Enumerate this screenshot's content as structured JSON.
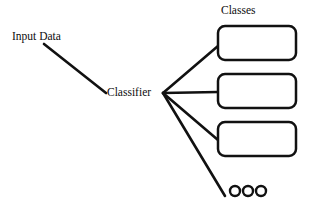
{
  "diagram": {
    "type": "classifier-flow-diagram",
    "background_color": "#ffffff",
    "stroke_color": "#111111",
    "text_color": "#0d0d0d",
    "labels": {
      "input": "Input Data",
      "classifier": "Classifier",
      "classes_title": "Classes"
    },
    "nodes": [
      {
        "id": "input-data",
        "kind": "text-label",
        "label": "Input Data",
        "x": 12,
        "y": 31
      },
      {
        "id": "classifier",
        "kind": "text-label",
        "label": "Classifier",
        "x": 107,
        "y": 87
      },
      {
        "id": "classes-title",
        "kind": "text-label",
        "label": "Classes",
        "x": 221,
        "y": 5
      }
    ],
    "class_boxes": [
      {
        "id": "class-box-1",
        "label": "",
        "x": 218,
        "y": 26,
        "width": 78,
        "height": 34,
        "rx": 7
      },
      {
        "id": "class-box-2",
        "label": "",
        "x": 218,
        "y": 74,
        "width": 78,
        "height": 34,
        "rx": 7
      },
      {
        "id": "class-box-3",
        "label": "",
        "x": 218,
        "y": 122,
        "width": 78,
        "height": 34,
        "rx": 7
      }
    ],
    "ellipsis_dots": {
      "id": "more-classes-ellipsis",
      "count": 3,
      "radius": 5,
      "centers": [
        {
          "x": 235,
          "y": 191
        },
        {
          "x": 248,
          "y": 191
        },
        {
          "x": 261,
          "y": 191
        }
      ]
    },
    "edges": [
      {
        "id": "edge-input-to-classifier",
        "from": "input-data",
        "to": "classifier",
        "x1": 44,
        "y1": 44,
        "x2": 106,
        "y2": 93,
        "width": 2.6
      },
      {
        "id": "edge-classifier-to-class-1",
        "from": "classifier",
        "to": "class-box-1",
        "x1": 163,
        "y1": 93,
        "x2": 218,
        "y2": 46,
        "width": 2.6
      },
      {
        "id": "edge-classifier-to-class-2",
        "from": "classifier",
        "to": "class-box-2",
        "x1": 163,
        "y1": 93,
        "x2": 218,
        "y2": 92,
        "width": 2.6
      },
      {
        "id": "edge-classifier-to-class-3",
        "from": "classifier",
        "to": "class-box-3",
        "x1": 163,
        "y1": 93,
        "x2": 218,
        "y2": 140,
        "width": 2.6
      },
      {
        "id": "edge-classifier-to-ellipsis",
        "from": "classifier",
        "to": "more-classes-ellipsis",
        "x1": 163,
        "y1": 93,
        "x2": 225,
        "y2": 196,
        "width": 2.6
      }
    ]
  }
}
